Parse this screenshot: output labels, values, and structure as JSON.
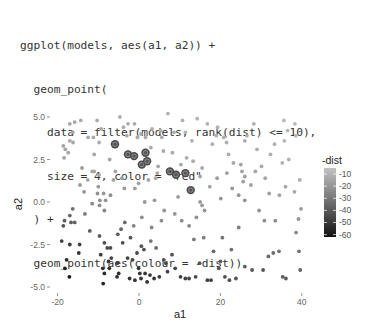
{
  "code": {
    "lines": [
      "ggplot(models, aes(a1, a2)) +",
      "  geom_point(",
      "    data = filter(models, rank(dist) <= 10),",
      "    size = 4, color = \"red\"",
      "  ) +",
      "  geom_point(aes(colour = -dist))"
    ]
  },
  "chart_data": {
    "type": "scatter",
    "title": "",
    "xlabel": "a1",
    "ylabel": "a2",
    "xlim": [
      -22,
      41
    ],
    "ylim": [
      -5.2,
      5.4
    ],
    "x_ticks": [
      -20,
      0,
      20,
      40
    ],
    "x_tick_labels": [
      "-20",
      "0",
      "20",
      "40"
    ],
    "y_ticks": [
      5.0,
      2.5,
      0.0,
      -2.5,
      -5.0
    ],
    "y_tick_labels": [
      "5.0",
      "2.5",
      "0.0",
      "-2.5",
      "-5.0"
    ],
    "grid": false,
    "legend": {
      "title": "-dist",
      "position": "right",
      "type": "colorbar",
      "range": [
        -62,
        -5
      ],
      "breaks": [
        -10,
        -20,
        -30,
        -40,
        -50,
        -60
      ],
      "break_labels": [
        "-10",
        "-20",
        "-30",
        "-40",
        "-50",
        "-60"
      ],
      "low_color": "#111111",
      "high_color": "#bdbdbd"
    },
    "highlight": {
      "description": "10 best models (rank(dist) <= 10), size 4",
      "points": [
        {
          "a1": -5.9,
          "a2": 3.4
        },
        {
          "a1": -2.7,
          "a2": 2.8
        },
        {
          "a1": -1.2,
          "a2": 2.7
        },
        {
          "a1": 1.6,
          "a2": 2.9
        },
        {
          "a1": 0.7,
          "a2": 2.2
        },
        {
          "a1": 2.0,
          "a2": 2.4
        },
        {
          "a1": 7.6,
          "a2": 1.8
        },
        {
          "a1": 9.1,
          "a2": 1.6
        },
        {
          "a1": 11.4,
          "a2": 1.7
        },
        {
          "a1": 12.7,
          "a2": 0.7
        }
      ]
    },
    "points": [
      {
        "a1": -17.0,
        "a2": 4.6,
        "v": -14
      },
      {
        "a1": -16.3,
        "a2": 4.1,
        "v": -14
      },
      {
        "a1": -15.8,
        "a2": 4.7,
        "v": -15
      },
      {
        "a1": -18.6,
        "a2": 3.3,
        "v": -15
      },
      {
        "a1": -18.1,
        "a2": 3.1,
        "v": -15
      },
      {
        "a1": -18.4,
        "a2": 2.6,
        "v": -16
      },
      {
        "a1": -17.0,
        "a2": 3.6,
        "v": -14
      },
      {
        "a1": -16.2,
        "a2": 3.5,
        "v": -14
      },
      {
        "a1": -17.4,
        "a2": 2.9,
        "v": -15
      },
      {
        "a1": -14.0,
        "a2": 2.0,
        "v": -18
      },
      {
        "a1": -12.5,
        "a2": 3.8,
        "v": -13
      },
      {
        "a1": -11.0,
        "a2": 2.8,
        "v": -14
      },
      {
        "a1": -11.2,
        "a2": 3.8,
        "v": -13
      },
      {
        "a1": -10.3,
        "a2": 4.8,
        "v": -12
      },
      {
        "a1": -9.8,
        "a2": 3.5,
        "v": -12
      },
      {
        "a1": -9.3,
        "a2": 4.3,
        "v": -12
      },
      {
        "a1": -11.5,
        "a2": 1.8,
        "v": -14
      },
      {
        "a1": -11.0,
        "a2": 1.8,
        "v": -14
      },
      {
        "a1": -9.8,
        "a2": 1.6,
        "v": -14
      },
      {
        "a1": -12.6,
        "a2": 1.3,
        "v": -14
      },
      {
        "a1": -13.5,
        "a2": 0.6,
        "v": -20
      },
      {
        "a1": -10.0,
        "a2": 0.9,
        "v": -18
      },
      {
        "a1": -10.2,
        "a2": 0.5,
        "v": -20
      },
      {
        "a1": -9.6,
        "a2": 0.1,
        "v": -21
      },
      {
        "a1": -7.0,
        "a2": 0.4,
        "v": -22
      },
      {
        "a1": -8.7,
        "a2": 0.5,
        "v": -19
      },
      {
        "a1": -8.2,
        "a2": 0.1,
        "v": -20
      },
      {
        "a1": -9.7,
        "a2": -0.2,
        "v": -22
      },
      {
        "a1": -8.5,
        "a2": -0.5,
        "v": -24
      },
      {
        "a1": -11.5,
        "a2": -0.1,
        "v": -24
      },
      {
        "a1": -13.3,
        "a2": -0.7,
        "v": -28
      },
      {
        "a1": -17.0,
        "a2": -0.8,
        "v": -35
      },
      {
        "a1": -16.3,
        "a2": -0.4,
        "v": -32
      },
      {
        "a1": -18.3,
        "a2": -1.1,
        "v": -38
      },
      {
        "a1": -18.6,
        "a2": -1.4,
        "v": -40
      },
      {
        "a1": -16.7,
        "a2": -1.2,
        "v": -38
      },
      {
        "a1": -15.8,
        "a2": -1.2,
        "v": -36
      },
      {
        "a1": -17.0,
        "a2": -2.5,
        "v": -48
      },
      {
        "a1": -14.6,
        "a2": -2.5,
        "v": -46
      },
      {
        "a1": -14.8,
        "a2": -3.0,
        "v": -50
      },
      {
        "a1": -17.8,
        "a2": -3.4,
        "v": -54
      },
      {
        "a1": -18.2,
        "a2": -3.9,
        "v": -57
      },
      {
        "a1": -17.1,
        "a2": -4.4,
        "v": -60
      },
      {
        "a1": -12.1,
        "a2": -1.7,
        "v": -38
      },
      {
        "a1": -9.7,
        "a2": -2.0,
        "v": -38
      },
      {
        "a1": -8.5,
        "a2": -2.4,
        "v": -42
      },
      {
        "a1": -7.8,
        "a2": -2.7,
        "v": -44
      },
      {
        "a1": -6.8,
        "a2": -3.3,
        "v": -46
      },
      {
        "a1": -9.4,
        "a2": -3.1,
        "v": -48
      },
      {
        "a1": -7.5,
        "a2": -3.5,
        "v": -50
      },
      {
        "a1": -5.3,
        "a2": -3.6,
        "v": -47
      },
      {
        "a1": -8.9,
        "a2": -3.9,
        "v": -52
      },
      {
        "a1": -8.5,
        "a2": -4.2,
        "v": -53
      },
      {
        "a1": -7.3,
        "a2": -3.9,
        "v": -51
      },
      {
        "a1": -5.0,
        "a2": -4.2,
        "v": -52
      },
      {
        "a1": -5.4,
        "a2": -4.4,
        "v": -52
      },
      {
        "a1": -8.8,
        "a2": -4.8,
        "v": -56
      },
      {
        "a1": -7.0,
        "a2": -2.7,
        "v": -42
      },
      {
        "a1": -5.2,
        "a2": -1.9,
        "v": -38
      },
      {
        "a1": -4.0,
        "a2": -2.4,
        "v": -42
      },
      {
        "a1": -2.1,
        "a2": -2.1,
        "v": -40
      },
      {
        "a1": -3.5,
        "a2": -1.2,
        "v": -33
      },
      {
        "a1": -4.4,
        "a2": -1.6,
        "v": -35
      },
      {
        "a1": -2.8,
        "a2": -3.3,
        "v": -46
      },
      {
        "a1": -1.6,
        "a2": -3.4,
        "v": -46
      },
      {
        "a1": -0.5,
        "a2": -3.0,
        "v": -44
      },
      {
        "a1": 0.6,
        "a2": -2.6,
        "v": -41
      },
      {
        "a1": 1.2,
        "a2": -2.8,
        "v": -42
      },
      {
        "a1": -0.1,
        "a2": -3.9,
        "v": -50
      },
      {
        "a1": 0.2,
        "a2": -4.2,
        "v": -50
      },
      {
        "a1": 1.5,
        "a2": -4.2,
        "v": -50
      },
      {
        "a1": 2.7,
        "a2": -4.3,
        "v": -49
      },
      {
        "a1": 3.7,
        "a2": -4.5,
        "v": -50
      },
      {
        "a1": 5.0,
        "a2": -4.4,
        "v": -48
      },
      {
        "a1": 2.0,
        "a2": -4.7,
        "v": -52
      },
      {
        "a1": 0.5,
        "a2": -4.5,
        "v": -50
      },
      {
        "a1": -1.0,
        "a2": -4.6,
        "v": -51
      },
      {
        "a1": -2.3,
        "a2": -4.5,
        "v": -50
      },
      {
        "a1": 6.1,
        "a2": -3.4,
        "v": -43
      },
      {
        "a1": 6.6,
        "a2": -3.6,
        "v": -44
      },
      {
        "a1": 7.0,
        "a2": -4.1,
        "v": -46
      },
      {
        "a1": 8.1,
        "a2": -3.1,
        "v": -41
      },
      {
        "a1": 8.9,
        "a2": -3.9,
        "v": -45
      },
      {
        "a1": 10.2,
        "a2": -4.4,
        "v": -47
      },
      {
        "a1": 11.4,
        "a2": -4.5,
        "v": -46
      },
      {
        "a1": 12.3,
        "a2": -4.5,
        "v": -46
      },
      {
        "a1": 13.9,
        "a2": -4.4,
        "v": -44
      },
      {
        "a1": 14.9,
        "a2": -3.6,
        "v": -40
      },
      {
        "a1": 16.8,
        "a2": -4.6,
        "v": -46
      },
      {
        "a1": 17.7,
        "a2": -4.6,
        "v": -46
      },
      {
        "a1": 19.6,
        "a2": -3.9,
        "v": -40
      },
      {
        "a1": 20.0,
        "a2": -3.5,
        "v": -38
      },
      {
        "a1": 21.1,
        "a2": -4.4,
        "v": -42
      },
      {
        "a1": 22.2,
        "a2": -4.6,
        "v": -42
      },
      {
        "a1": 23.8,
        "a2": -4.5,
        "v": -40
      },
      {
        "a1": 18.3,
        "a2": -2.9,
        "v": -34
      },
      {
        "a1": 20.5,
        "a2": -2.1,
        "v": -30
      },
      {
        "a1": 22.7,
        "a2": -2.8,
        "v": -32
      },
      {
        "a1": 24.5,
        "a2": -1.5,
        "v": -26
      },
      {
        "a1": 26.0,
        "a2": -3.8,
        "v": -38
      },
      {
        "a1": 27.8,
        "a2": -4.0,
        "v": -40
      },
      {
        "a1": 30.5,
        "a2": -4.0,
        "v": -40
      },
      {
        "a1": 31.8,
        "a2": -3.2,
        "v": -34
      },
      {
        "a1": 33.0,
        "a2": -3.0,
        "v": -32
      },
      {
        "a1": 34.4,
        "a2": -2.9,
        "v": -30
      },
      {
        "a1": 35.3,
        "a2": -4.4,
        "v": -38
      },
      {
        "a1": 36.1,
        "a2": -4.5,
        "v": -38
      },
      {
        "a1": 38.6,
        "a2": -1.8,
        "v": -24
      },
      {
        "a1": 39.3,
        "a2": -2.9,
        "v": -30
      },
      {
        "a1": 39.6,
        "a2": -4.0,
        "v": -36
      },
      {
        "a1": 39.2,
        "a2": -1.0,
        "v": -20
      },
      {
        "a1": 39.8,
        "a2": -0.4,
        "v": -18
      },
      {
        "a1": 38.2,
        "a2": 0.6,
        "v": -14
      },
      {
        "a1": 39.5,
        "a2": 1.3,
        "v": -12
      },
      {
        "a1": 36.8,
        "a2": 2.5,
        "v": -10
      },
      {
        "a1": 35.2,
        "a2": 2.3,
        "v": -10
      },
      {
        "a1": 35.7,
        "a2": 3.6,
        "v": -9
      },
      {
        "a1": 38.5,
        "a2": 3.9,
        "v": -9
      },
      {
        "a1": 38.3,
        "a2": 4.6,
        "v": -9
      },
      {
        "a1": 35.6,
        "a2": 4.8,
        "v": -9
      },
      {
        "a1": 36.5,
        "a2": 4.2,
        "v": -9
      },
      {
        "a1": 32.3,
        "a2": 2.8,
        "v": -11
      },
      {
        "a1": 33.3,
        "a2": 3.4,
        "v": -11
      },
      {
        "a1": 29.0,
        "a2": 3.1,
        "v": -12
      },
      {
        "a1": 28.2,
        "a2": 4.6,
        "v": -11
      },
      {
        "a1": 26.5,
        "a2": 3.9,
        "v": -12
      },
      {
        "a1": 26.0,
        "a2": 3.6,
        "v": -12
      },
      {
        "a1": 25.0,
        "a2": 2.2,
        "v": -15
      },
      {
        "a1": 25.3,
        "a2": 1.8,
        "v": -15
      },
      {
        "a1": 26.0,
        "a2": 1.5,
        "v": -16
      },
      {
        "a1": 25.6,
        "a2": 1.2,
        "v": -17
      },
      {
        "a1": 23.2,
        "a2": 2.3,
        "v": -14
      },
      {
        "a1": 21.6,
        "a2": 1.7,
        "v": -16
      },
      {
        "a1": 19.2,
        "a2": 1.4,
        "v": -17
      },
      {
        "a1": 20.1,
        "a2": 0.2,
        "v": -20
      },
      {
        "a1": 22.9,
        "a2": 0.8,
        "v": -19
      },
      {
        "a1": 24.5,
        "a2": 0.4,
        "v": -20
      },
      {
        "a1": 26.0,
        "a2": 0.1,
        "v": -20
      },
      {
        "a1": 27.5,
        "a2": 1.0,
        "v": -16
      },
      {
        "a1": 29.5,
        "a2": -0.5,
        "v": -20
      },
      {
        "a1": 30.8,
        "a2": -1.1,
        "v": -22
      },
      {
        "a1": 33.5,
        "a2": -1.1,
        "v": -22
      },
      {
        "a1": 32.0,
        "a2": 0.5,
        "v": -16
      },
      {
        "a1": 34.5,
        "a2": 0.4,
        "v": -15
      },
      {
        "a1": 36.0,
        "a2": 0.9,
        "v": -14
      },
      {
        "a1": 30.1,
        "a2": 2.1,
        "v": -13
      },
      {
        "a1": 31.0,
        "a2": 1.4,
        "v": -14
      },
      {
        "a1": 28.6,
        "a2": 1.8,
        "v": -14
      },
      {
        "a1": 20.8,
        "a2": 3.8,
        "v": -11
      },
      {
        "a1": 21.5,
        "a2": 3.5,
        "v": -11
      },
      {
        "a1": 22.0,
        "a2": 2.8,
        "v": -12
      },
      {
        "a1": 19.3,
        "a2": 4.4,
        "v": -10
      },
      {
        "a1": 19.0,
        "a2": 3.9,
        "v": -10
      },
      {
        "a1": 18.0,
        "a2": 3.4,
        "v": -11
      },
      {
        "a1": 16.8,
        "a2": 4.6,
        "v": -10
      },
      {
        "a1": 14.3,
        "a2": 4.9,
        "v": -10
      },
      {
        "a1": 13.0,
        "a2": 3.6,
        "v": -11
      },
      {
        "a1": 10.7,
        "a2": 4.8,
        "v": -10
      },
      {
        "a1": 11.4,
        "a2": 4.1,
        "v": -10
      },
      {
        "a1": 8.6,
        "a2": 4.1,
        "v": -11
      },
      {
        "a1": 7.1,
        "a2": 5.2,
        "v": -10
      },
      {
        "a1": 5.3,
        "a2": 4.2,
        "v": -11
      },
      {
        "a1": 5.6,
        "a2": 3.8,
        "v": -11
      },
      {
        "a1": 3.2,
        "a2": 4.3,
        "v": -11
      },
      {
        "a1": 1.6,
        "a2": 3.8,
        "v": -12
      },
      {
        "a1": -1.1,
        "a2": 4.6,
        "v": -12
      },
      {
        "a1": -2.7,
        "a2": 4.6,
        "v": -12
      },
      {
        "a1": -3.8,
        "a2": 4.4,
        "v": -12
      },
      {
        "a1": -4.7,
        "a2": 5.0,
        "v": -11
      },
      {
        "a1": 10.3,
        "a2": 2.2,
        "v": -13
      },
      {
        "a1": 11.7,
        "a2": 2.6,
        "v": -12
      },
      {
        "a1": 13.3,
        "a2": 2.4,
        "v": -12
      },
      {
        "a1": 15.0,
        "a2": 1.5,
        "v": -14
      },
      {
        "a1": 15.5,
        "a2": 2.0,
        "v": -13
      },
      {
        "a1": 17.4,
        "a2": 0.9,
        "v": -15
      },
      {
        "a1": 16.1,
        "a2": -0.5,
        "v": -19
      },
      {
        "a1": 15.5,
        "a2": -0.2,
        "v": -18
      },
      {
        "a1": 15.0,
        "a2": 0.0,
        "v": -18
      },
      {
        "a1": 9.6,
        "a2": 0.3,
        "v": -17
      },
      {
        "a1": 8.8,
        "a2": -0.7,
        "v": -20
      },
      {
        "a1": 10.5,
        "a2": -1.1,
        "v": -22
      },
      {
        "a1": 12.3,
        "a2": -1.4,
        "v": -24
      },
      {
        "a1": 14.1,
        "a2": -0.9,
        "v": -21
      },
      {
        "a1": 13.5,
        "a2": -2.2,
        "v": -28
      },
      {
        "a1": 15.9,
        "a2": -2.1,
        "v": -27
      },
      {
        "a1": 4.5,
        "a2": 1.7,
        "v": -14
      },
      {
        "a1": 4.1,
        "a2": 1.4,
        "v": -14
      },
      {
        "a1": 2.3,
        "a2": 1.3,
        "v": -15
      },
      {
        "a1": -0.1,
        "a2": 1.1,
        "v": -16
      },
      {
        "a1": -1.0,
        "a2": 0.8,
        "v": -17
      },
      {
        "a1": 3.8,
        "a2": 0.1,
        "v": -18
      },
      {
        "a1": 6.2,
        "a2": -0.5,
        "v": -20
      },
      {
        "a1": 5.5,
        "a2": -1.1,
        "v": -22
      },
      {
        "a1": 3.1,
        "a2": -1.5,
        "v": -24
      },
      {
        "a1": 0.7,
        "a2": -0.9,
        "v": -22
      },
      {
        "a1": -1.3,
        "a2": -1.4,
        "v": -25
      },
      {
        "a1": 2.9,
        "a2": -2.3,
        "v": -30
      },
      {
        "a1": 4.2,
        "a2": -2.7,
        "v": -33
      },
      {
        "a1": 1.4,
        "a2": 0.0,
        "v": -19
      },
      {
        "a1": -3.6,
        "a2": 0.8,
        "v": -18
      },
      {
        "a1": -5.8,
        "a2": 1.8,
        "v": -15
      },
      {
        "a1": -6.3,
        "a2": 1.3,
        "v": -16
      },
      {
        "a1": -4.2,
        "a2": 1.4,
        "v": -16
      },
      {
        "a1": -7.2,
        "a2": 2.5,
        "v": -14
      },
      {
        "a1": -3.0,
        "a2": 3.9,
        "v": -13
      },
      {
        "a1": -0.4,
        "a2": 3.8,
        "v": -13
      },
      {
        "a1": 0.5,
        "a2": 4.0,
        "v": -13
      },
      {
        "a1": 2.9,
        "a2": 3.2,
        "v": -13
      },
      {
        "a1": 6.0,
        "a2": 3.0,
        "v": -13
      },
      {
        "a1": 8.2,
        "a2": 2.9,
        "v": -13
      },
      {
        "a1": 4.7,
        "a2": 2.1,
        "v": -14
      },
      {
        "a1": -14.5,
        "a2": 1.0,
        "v": -18
      },
      {
        "a1": -14.3,
        "a2": 4.8,
        "v": -13
      },
      {
        "a1": -19.0,
        "a2": -2.3,
        "v": -46
      }
    ]
  }
}
